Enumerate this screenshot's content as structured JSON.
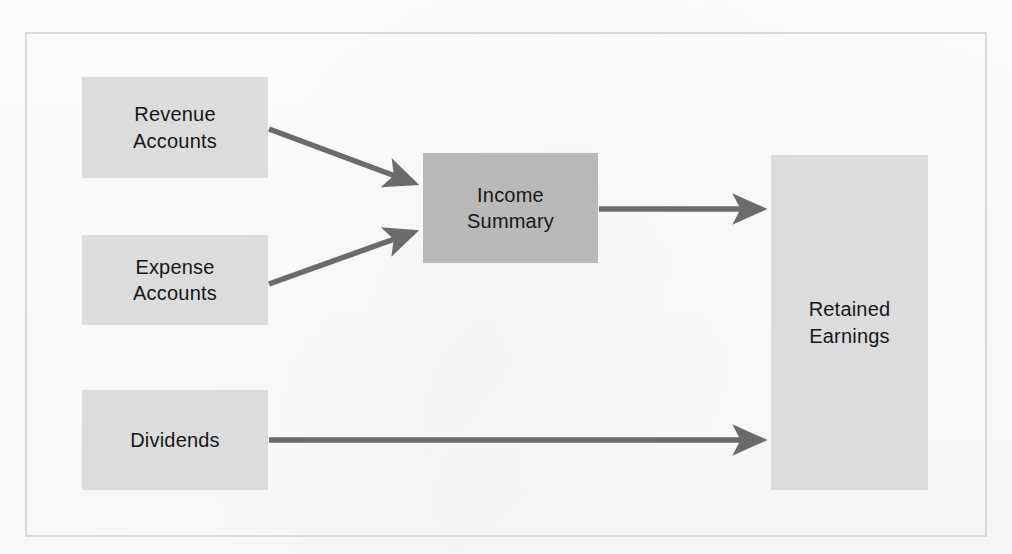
{
  "diagram": {
    "frame": {
      "border_color": "#d9d9d9",
      "background": "#fdfdfd"
    },
    "palette": {
      "node_light": "#dcdcdc",
      "node_dark": "#b9b9b9",
      "arrow": "#6b6b6b",
      "text": "#16161a"
    },
    "nodes": [
      {
        "id": "revenue-accounts",
        "label": "Revenue\nAccounts",
        "shade": "light",
        "x": 82,
        "y": 77,
        "w": 186,
        "h": 101
      },
      {
        "id": "expense-accounts",
        "label": "Expense\nAccounts",
        "shade": "light",
        "x": 82,
        "y": 235,
        "w": 186,
        "h": 90
      },
      {
        "id": "dividends",
        "label": "Dividends",
        "shade": "light",
        "x": 82,
        "y": 390,
        "w": 186,
        "h": 100
      },
      {
        "id": "income-summary",
        "label": "Income\nSummary",
        "shade": "dark",
        "x": 423,
        "y": 153,
        "w": 175,
        "h": 110
      },
      {
        "id": "retained-earnings",
        "label": "Retained\nEarnings",
        "shade": "light",
        "x": 771,
        "y": 155,
        "w": 157,
        "h": 335
      }
    ],
    "arrows": [
      {
        "id": "revenue-to-income-summary",
        "from": "revenue-accounts",
        "to": "income-summary",
        "x1": 269,
        "y1": 129,
        "x2": 421,
        "y2": 186
      },
      {
        "id": "expense-to-income-summary",
        "from": "expense-accounts",
        "to": "income-summary",
        "x1": 269,
        "y1": 284,
        "x2": 421,
        "y2": 229
      },
      {
        "id": "income-summary-to-retained-earnings",
        "from": "income-summary",
        "to": "retained-earnings",
        "x1": 599,
        "y1": 209,
        "x2": 769,
        "y2": 209
      },
      {
        "id": "dividends-to-retained-earnings",
        "from": "dividends",
        "to": "retained-earnings",
        "x1": 269,
        "y1": 440,
        "x2": 769,
        "y2": 440
      }
    ]
  }
}
